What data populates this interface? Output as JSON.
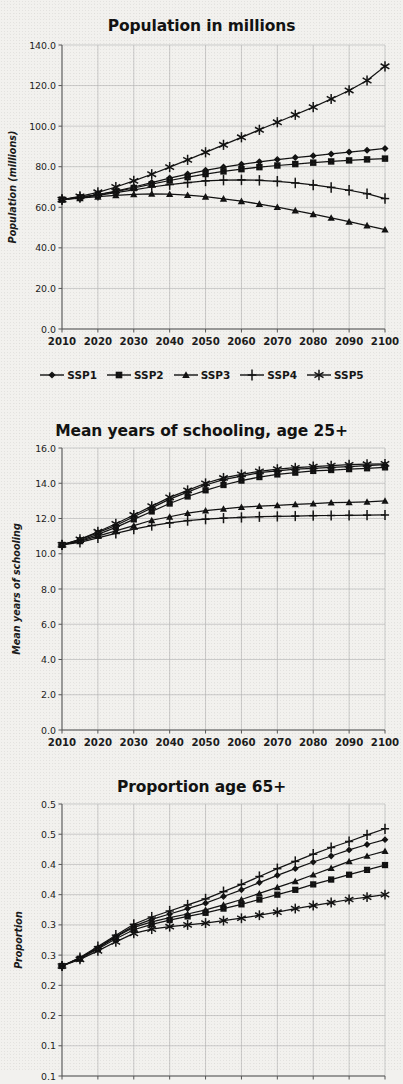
{
  "figure": {
    "background_color": "#f2f1ee",
    "ink_color": "#111111",
    "gridline_color": "#b9b9b9"
  },
  "legend": {
    "position": "below-first-chart",
    "entries": [
      {
        "label": "SSP1",
        "marker": "diamond"
      },
      {
        "label": "SSP2",
        "marker": "square"
      },
      {
        "label": "SSP3",
        "marker": "triangle"
      },
      {
        "label": "SSP4",
        "marker": "plus"
      },
      {
        "label": "SSP5",
        "marker": "asterisk"
      }
    ]
  },
  "chart_data": [
    {
      "id": "population",
      "type": "line",
      "title": "Population in millions",
      "xlabel": "",
      "ylabel": "Population (millions)",
      "x": [
        2010,
        2015,
        2020,
        2025,
        2030,
        2035,
        2040,
        2045,
        2050,
        2055,
        2060,
        2065,
        2070,
        2075,
        2080,
        2085,
        2090,
        2095,
        2100
      ],
      "xticks": [
        2010,
        2020,
        2030,
        2040,
        2050,
        2060,
        2070,
        2080,
        2090,
        2100
      ],
      "xticklabels": [
        "2010",
        "2020",
        "2030",
        "2040",
        "2050",
        "2060",
        "2070",
        "2080",
        "2090",
        "2100"
      ],
      "xlim": [
        2010,
        2100
      ],
      "ylim": [
        0.0,
        140.0
      ],
      "yticks": [
        0.0,
        20.0,
        40.0,
        60.0,
        80.0,
        100.0,
        120.0,
        140.0
      ],
      "yticklabels": [
        "0.0",
        "20.0",
        "40.0",
        "60.0",
        "80.0",
        "100.0",
        "120.0",
        "140.0"
      ],
      "grid": true,
      "series": [
        {
          "name": "SSP1",
          "marker": "diamond",
          "values": [
            63.8,
            65.0,
            66.3,
            68.0,
            70.0,
            72.2,
            74.4,
            76.4,
            78.2,
            79.8,
            81.2,
            82.4,
            83.5,
            84.5,
            85.4,
            86.3,
            87.2,
            88.1,
            89.0
          ]
        },
        {
          "name": "SSP2",
          "marker": "square",
          "values": [
            63.8,
            64.9,
            66.1,
            67.7,
            69.5,
            71.4,
            73.2,
            74.9,
            76.4,
            77.7,
            78.8,
            79.8,
            80.6,
            81.3,
            82.0,
            82.6,
            83.1,
            83.6,
            84.0
          ]
        },
        {
          "name": "SSP3",
          "marker": "triangle",
          "values": [
            63.8,
            64.5,
            65.2,
            65.9,
            66.4,
            66.6,
            66.5,
            66.0,
            65.2,
            64.2,
            63.0,
            61.6,
            60.1,
            58.4,
            56.6,
            54.8,
            52.9,
            51.0,
            49.0
          ]
        },
        {
          "name": "SSP4",
          "marker": "plus",
          "values": [
            63.8,
            64.8,
            65.9,
            67.2,
            68.6,
            70.0,
            71.2,
            72.2,
            73.0,
            73.4,
            73.5,
            73.3,
            72.8,
            72.0,
            71.0,
            69.8,
            68.4,
            66.7,
            64.3
          ]
        },
        {
          "name": "SSP5",
          "marker": "asterisk",
          "values": [
            63.8,
            65.4,
            67.4,
            70.0,
            73.0,
            76.3,
            79.8,
            83.4,
            87.1,
            90.8,
            94.5,
            98.2,
            101.9,
            105.6,
            109.4,
            113.4,
            117.6,
            122.5,
            129.5
          ]
        }
      ]
    },
    {
      "id": "schooling",
      "type": "line",
      "title": "Mean years of schooling, age 25+",
      "xlabel": "",
      "ylabel": "Mean years of schooling",
      "x": [
        2010,
        2015,
        2020,
        2025,
        2030,
        2035,
        2040,
        2045,
        2050,
        2055,
        2060,
        2065,
        2070,
        2075,
        2080,
        2085,
        2090,
        2095,
        2100
      ],
      "xticks": [
        2010,
        2020,
        2030,
        2040,
        2050,
        2060,
        2070,
        2080,
        2090,
        2100
      ],
      "xticklabels": [
        "2010",
        "2020",
        "2030",
        "2040",
        "2050",
        "2060",
        "2070",
        "2080",
        "2090",
        "2100"
      ],
      "xlim": [
        2010,
        2100
      ],
      "ylim": [
        0.0,
        16.0
      ],
      "yticks": [
        0.0,
        2.0,
        4.0,
        6.0,
        8.0,
        10.0,
        12.0,
        14.0,
        16.0
      ],
      "yticklabels": [
        "0.0",
        "2.0",
        "4.0",
        "6.0",
        "8.0",
        "10.0",
        "12.0",
        "14.0",
        "16.0"
      ],
      "grid": true,
      "series": [
        {
          "name": "SSP1",
          "marker": "diamond",
          "values": [
            10.5,
            10.8,
            11.2,
            11.6,
            12.1,
            12.6,
            13.1,
            13.5,
            13.9,
            14.2,
            14.4,
            14.6,
            14.7,
            14.8,
            14.85,
            14.9,
            14.95,
            15.0,
            15.05
          ]
        },
        {
          "name": "SSP2",
          "marker": "square",
          "values": [
            10.5,
            10.75,
            11.1,
            11.5,
            11.95,
            12.4,
            12.85,
            13.25,
            13.6,
            13.9,
            14.15,
            14.35,
            14.5,
            14.6,
            14.7,
            14.75,
            14.8,
            14.85,
            14.9
          ]
        },
        {
          "name": "SSP3",
          "marker": "triangle",
          "values": [
            10.5,
            10.7,
            11.0,
            11.3,
            11.6,
            11.9,
            12.1,
            12.3,
            12.45,
            12.55,
            12.65,
            12.7,
            12.75,
            12.8,
            12.85,
            12.9,
            12.92,
            12.95,
            13.0
          ]
        },
        {
          "name": "SSP4",
          "marker": "plus",
          "values": [
            10.5,
            10.65,
            10.9,
            11.15,
            11.4,
            11.6,
            11.75,
            11.88,
            11.96,
            12.02,
            12.06,
            12.1,
            12.12,
            12.14,
            12.16,
            12.17,
            12.18,
            12.19,
            12.2
          ]
        },
        {
          "name": "SSP5",
          "marker": "asterisk",
          "values": [
            10.5,
            10.82,
            11.25,
            11.7,
            12.2,
            12.7,
            13.2,
            13.6,
            14.0,
            14.3,
            14.5,
            14.68,
            14.8,
            14.88,
            14.95,
            15.0,
            15.05,
            15.08,
            15.1
          ]
        }
      ]
    },
    {
      "id": "proportion",
      "type": "line",
      "title": "Proportion age 65+",
      "xlabel": "",
      "ylabel": "Proportion",
      "x": [
        2010,
        2015,
        2020,
        2025,
        2030,
        2035,
        2040,
        2045,
        2050,
        2055,
        2060,
        2065,
        2070,
        2075,
        2080,
        2085,
        2090,
        2095,
        2100
      ],
      "xticks": [
        2010,
        2020,
        2030,
        2040,
        2050,
        2060,
        2070,
        2080,
        2090,
        2100
      ],
      "xticklabels": [
        "2010",
        "2020",
        "2030",
        "2040",
        "2050",
        "2060",
        "2070",
        "2080",
        "2090",
        "2100"
      ],
      "xlim": [
        2010,
        2100
      ],
      "ylim": [
        0.05,
        0.5
      ],
      "yticks": [
        0.5,
        0.45,
        0.4,
        0.35,
        0.3,
        0.25,
        0.2,
        0.15,
        0.1,
        0.05
      ],
      "yticklabels": [
        "0.5",
        "0.5",
        "0.4",
        "0.4",
        "0.3",
        "0.3",
        "0.2",
        "0.2",
        "0.1",
        "0.1"
      ],
      "grid": true,
      "series": [
        {
          "name": "SSP1",
          "marker": "diamond",
          "values": [
            0.232,
            0.245,
            0.262,
            0.281,
            0.298,
            0.309,
            0.318,
            0.327,
            0.336,
            0.347,
            0.358,
            0.37,
            0.382,
            0.393,
            0.404,
            0.414,
            0.424,
            0.433,
            0.441
          ]
        },
        {
          "name": "SSP2",
          "marker": "square",
          "values": [
            0.232,
            0.244,
            0.26,
            0.277,
            0.292,
            0.301,
            0.308,
            0.314,
            0.32,
            0.327,
            0.334,
            0.342,
            0.35,
            0.358,
            0.367,
            0.375,
            0.383,
            0.391,
            0.399
          ]
        },
        {
          "name": "SSP3",
          "marker": "triangle",
          "values": [
            0.232,
            0.245,
            0.262,
            0.28,
            0.296,
            0.305,
            0.312,
            0.318,
            0.325,
            0.333,
            0.342,
            0.352,
            0.362,
            0.372,
            0.383,
            0.394,
            0.405,
            0.414,
            0.422
          ]
        },
        {
          "name": "SSP4",
          "marker": "plus",
          "values": [
            0.232,
            0.246,
            0.264,
            0.283,
            0.301,
            0.313,
            0.323,
            0.333,
            0.343,
            0.355,
            0.367,
            0.38,
            0.393,
            0.405,
            0.417,
            0.428,
            0.438,
            0.449,
            0.459
          ]
        },
        {
          "name": "SSP5",
          "marker": "asterisk",
          "values": [
            0.232,
            0.243,
            0.257,
            0.272,
            0.286,
            0.293,
            0.297,
            0.3,
            0.303,
            0.307,
            0.311,
            0.316,
            0.321,
            0.327,
            0.332,
            0.337,
            0.342,
            0.346,
            0.35
          ]
        }
      ]
    }
  ]
}
